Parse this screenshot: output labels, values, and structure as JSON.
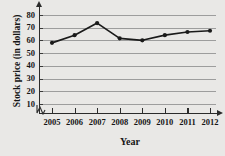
{
  "chart_data": {
    "type": "line",
    "title": "",
    "xlabel": "Year",
    "ylabel": "Stock price (in dollars)",
    "categories": [
      "2005",
      "2006",
      "2007",
      "2008",
      "2009",
      "2010",
      "2011",
      "2012"
    ],
    "values": [
      58,
      64,
      73.5,
      61.5,
      60,
      64,
      66.5,
      67.5
    ],
    "series": [
      {
        "name": "Stock price",
        "values": [
          58,
          64,
          73.5,
          61.5,
          60,
          64,
          66.5,
          67.5
        ]
      }
    ],
    "ylim": [
      0,
      85
    ],
    "yticks": [
      10,
      20,
      30,
      40,
      50,
      60,
      70,
      80
    ],
    "ytick_labels": [
      "10",
      "20",
      "30",
      "40",
      "50",
      "60",
      "70",
      "80"
    ],
    "grid": true,
    "grid_axis": "y",
    "legend": false,
    "legend_position": "none",
    "axis_break": true,
    "marker": "circle",
    "line_color": "#1a1a1a",
    "marker_color": "#1a1a1a",
    "grid_color": "#9d9d9d",
    "axis_color": "#2b2b2b",
    "background_color": "#e9e8e6"
  }
}
